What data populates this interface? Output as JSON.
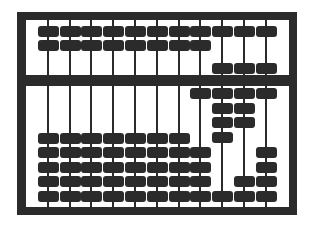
{
  "image": {
    "subject": "abacus",
    "colors": {
      "frame": "#2b2b2b",
      "bead": "#2b2b2b",
      "background": "#ffffff"
    },
    "rod_count": 11,
    "upper_beads_per_rod": 2,
    "lower_beads_per_rod": 5,
    "rods": [
      {
        "x": 48,
        "upper_lowered": 0,
        "lower_raised": 0
      },
      {
        "x": 70,
        "upper_lowered": 0,
        "lower_raised": 0
      },
      {
        "x": 91,
        "upper_lowered": 0,
        "lower_raised": 0
      },
      {
        "x": 113,
        "upper_lowered": 0,
        "lower_raised": 0
      },
      {
        "x": 135,
        "upper_lowered": 0,
        "lower_raised": 0
      },
      {
        "x": 157,
        "upper_lowered": 0,
        "lower_raised": 0
      },
      {
        "x": 179,
        "upper_lowered": 0,
        "lower_raised": 0
      },
      {
        "x": 200,
        "upper_lowered": 0,
        "lower_raised": 1
      },
      {
        "x": 222,
        "upper_lowered": 1,
        "lower_raised": 4
      },
      {
        "x": 244,
        "upper_lowered": 1,
        "lower_raised": 3
      },
      {
        "x": 266,
        "upper_lowered": 1,
        "lower_raised": 1
      }
    ]
  }
}
